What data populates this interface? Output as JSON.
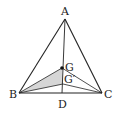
{
  "diagram": {
    "type": "geometry",
    "colors": {
      "stroke": "#222222",
      "shade": "#d6d6d6",
      "background": "#ffffff"
    },
    "points": {
      "A": {
        "label": "A",
        "x": 65,
        "y": 19
      },
      "B": {
        "label": "B",
        "x": 19,
        "y": 93
      },
      "C": {
        "label": "C",
        "x": 102,
        "y": 93
      },
      "D": {
        "label": "D",
        "x": 62,
        "y": 93
      },
      "G": {
        "label": "G",
        "x": 62,
        "y": 68
      },
      "Gp": {
        "label": "G′",
        "x": 63,
        "y": 84
      }
    },
    "segments": [
      [
        "A",
        "B"
      ],
      [
        "A",
        "C"
      ],
      [
        "B",
        "C"
      ],
      [
        "A",
        "D"
      ],
      [
        "B",
        "G"
      ],
      [
        "G",
        "C"
      ],
      [
        "B",
        "Gp"
      ],
      [
        "Gp",
        "C"
      ]
    ],
    "shaded_region": [
      "B",
      "G",
      "Gp"
    ],
    "labels": {
      "A": "A",
      "B": "B",
      "C": "C",
      "D": "D",
      "G": "G",
      "Gp": "G′"
    }
  }
}
